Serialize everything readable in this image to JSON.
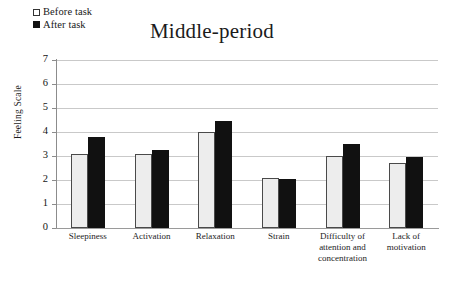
{
  "chart_data": {
    "type": "bar",
    "title": "Middle-period",
    "xlabel": "",
    "ylabel": "Feeling Scale",
    "ylim": [
      0,
      7
    ],
    "yticks": [
      0,
      1,
      2,
      3,
      4,
      5,
      6,
      7
    ],
    "grid": true,
    "legend_position": "top-left",
    "categories": [
      "Sleepiness",
      "Activation",
      "Relaxation",
      "Strain",
      "Difficulty of attention and concentration",
      "Lack of motivation"
    ],
    "series": [
      {
        "name": "Before task",
        "color": "#ededed",
        "marker": "open-square",
        "values": [
          3.1,
          3.1,
          4.0,
          2.1,
          3.0,
          2.7
        ]
      },
      {
        "name": "After task",
        "color": "#111111",
        "marker": "filled-square",
        "values": [
          3.8,
          3.25,
          4.45,
          2.05,
          3.5,
          2.95
        ]
      }
    ]
  },
  "legend": {
    "items": [
      {
        "label": "Before task",
        "swatch": "open-square"
      },
      {
        "label": "After task",
        "swatch": "filled-square"
      }
    ]
  }
}
